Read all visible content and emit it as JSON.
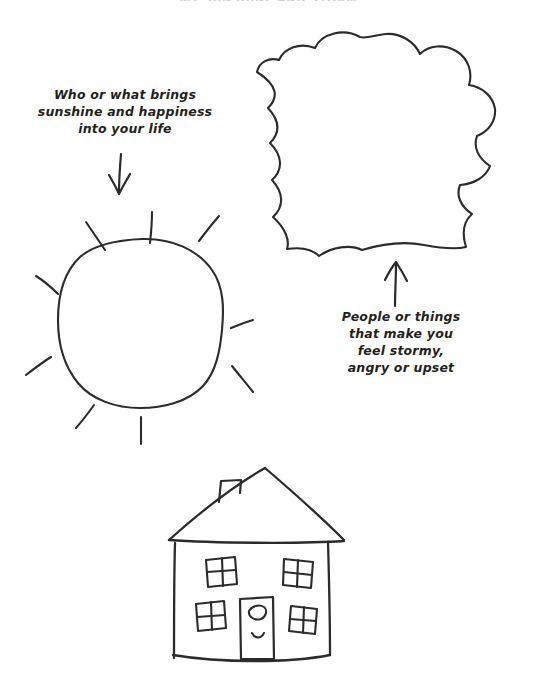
{
  "page": {
    "title": "MY SUNSHINE AND STORM",
    "background_color": "#ffffff",
    "ink_color": "#2b2b2b",
    "text_color": "#231f20",
    "width": 537,
    "height": 690
  },
  "captions": {
    "sunshine": "Who or what brings\nsunshine and happiness\ninto your life",
    "storm": "People or things\nthat make you\nfeel stormy,\nangry or upset"
  },
  "drawings": {
    "sun": {
      "label": "sun",
      "center_x": 140,
      "center_y": 318,
      "radius": 82,
      "ray_count": 9
    },
    "cloud": {
      "label": "cloud",
      "center_x": 378,
      "center_y": 138,
      "width": 230,
      "height": 215
    },
    "house": {
      "label": "house",
      "center_x": 250,
      "center_y": 565,
      "windows": 4,
      "doors": 1,
      "chimneys": 1
    }
  },
  "arrows": {
    "to_sun": {
      "label": "arrow-down-to-sun",
      "direction": "down",
      "x1": 120,
      "y1": 153,
      "x2": 120,
      "y2": 194
    },
    "to_cloud": {
      "label": "arrow-up-to-cloud",
      "direction": "up",
      "x1": 396,
      "y1": 306,
      "x2": 396,
      "y2": 262
    }
  }
}
